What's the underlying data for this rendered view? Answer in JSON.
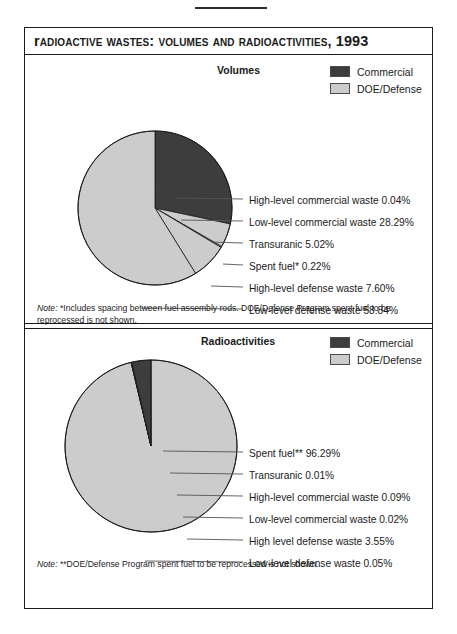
{
  "figure": {
    "title": "Radioactive Wastes: Volumes and Radioactivities, 1993",
    "colors": {
      "commercial": "#3d3d3d",
      "doe_defense": "#cccccc",
      "outline": "#1a1a1a",
      "leader_line": "#555555"
    }
  },
  "legend": {
    "commercial": "Commercial",
    "doe_defense": "DOE/Defense"
  },
  "panels": [
    {
      "heading": "Volumes",
      "note_word": "Note:",
      "note_text": " *Includes spacing between fuel assembly rods. DOE/Defense Program spent fuel to be reprocessed is not shown."
    },
    {
      "heading": "Radioactivities",
      "note_word": "Note:",
      "note_text": " **DOE/Defense Program spent fuel to be reprocessed is not shown."
    }
  ],
  "chart_data": [
    {
      "type": "pie",
      "title": "Volumes",
      "start_angle": 0,
      "direction": "clockwise",
      "legend_position": "top-right",
      "categories": [
        "High-level commercial waste",
        "Low-level commercial waste",
        "Transuranic",
        "Spent fuel*",
        "High-level defense waste",
        "Low-level defense waste"
      ],
      "values": [
        0.04,
        28.29,
        5.02,
        0.22,
        7.6,
        58.84
      ],
      "units": "percent",
      "labels": [
        "High-level commercial waste 0.04%",
        "Low-level commercial waste 28.29%",
        "Transuranic 5.02%",
        "Spent fuel* 0.22%",
        "High-level defense waste 7.60%",
        "Low-level defense waste 58.84%"
      ],
      "groups": [
        "commercial",
        "commercial",
        "doe_defense",
        "doe_defense",
        "doe_defense",
        "doe_defense"
      ]
    },
    {
      "type": "pie",
      "title": "Radioactivities",
      "start_angle": 0,
      "direction": "clockwise",
      "legend_position": "top-right",
      "categories": [
        "Spent fuel**",
        "Transuranic",
        "High-level commercial waste",
        "Low-level commercial waste",
        "High level defense waste",
        "Low-level defense waste"
      ],
      "values": [
        96.29,
        0.01,
        0.09,
        0.02,
        3.55,
        0.05
      ],
      "units": "percent",
      "labels": [
        "Spent fuel** 96.29%",
        "Transuranic 0.01%",
        "High-level commercial waste 0.09%",
        "Low-level commercial waste 0.02%",
        "High level defense waste 3.55%",
        "Low-level defense waste 0.05%"
      ],
      "groups": [
        "doe_defense",
        "doe_defense",
        "commercial",
        "commercial",
        "commercial",
        "doe_defense"
      ]
    }
  ],
  "label_positions": {
    "volumes": [
      {
        "text_x": 224,
        "text_y": 140,
        "line_from_x": 130,
        "line_from_y": 86,
        "anchor_x": 150,
        "anchor_y": 143
      },
      {
        "text_x": 224,
        "text_y": 162,
        "line_from_x": 130,
        "line_from_y": 153,
        "anchor_x": 156,
        "anchor_y": 165
      },
      {
        "text_x": 224,
        "text_y": 184,
        "line_from_x": 130,
        "line_from_y": 153,
        "anchor_x": 186,
        "anchor_y": 187
      },
      {
        "text_x": 224,
        "text_y": 206,
        "line_from_x": 130,
        "line_from_y": 153,
        "anchor_x": 198,
        "anchor_y": 209
      },
      {
        "text_x": 224,
        "text_y": 228,
        "line_from_x": 130,
        "line_from_y": 153,
        "anchor_x": 186,
        "anchor_y": 231
      },
      {
        "text_x": 224,
        "text_y": 250,
        "line_from_x": 130,
        "line_from_y": 153,
        "anchor_x": 116,
        "anchor_y": 253
      }
    ],
    "radio": [
      {
        "text_x": 224,
        "text_y": 120,
        "line_from_x": 126,
        "line_from_y": 118,
        "anchor_x": 138,
        "anchor_y": 123
      },
      {
        "text_x": 224,
        "text_y": 142,
        "line_from_x": 126,
        "line_from_y": 118,
        "anchor_x": 145,
        "anchor_y": 145
      },
      {
        "text_x": 224,
        "text_y": 164,
        "line_from_x": 126,
        "line_from_y": 118,
        "anchor_x": 152,
        "anchor_y": 167
      },
      {
        "text_x": 224,
        "text_y": 186,
        "line_from_x": 126,
        "line_from_y": 118,
        "anchor_x": 158,
        "anchor_y": 189
      },
      {
        "text_x": 224,
        "text_y": 208,
        "line_from_x": 126,
        "line_from_y": 118,
        "anchor_x": 162,
        "anchor_y": 211
      },
      {
        "text_x": 224,
        "text_y": 230,
        "line_from_x": 126,
        "line_from_y": 118,
        "anchor_x": 120,
        "anchor_y": 233
      }
    ]
  },
  "pie_geometry": {
    "volumes": {
      "cx": 130,
      "cy": 153,
      "r": 77
    },
    "radio": {
      "cx": 126,
      "cy": 118,
      "r": 86
    }
  }
}
